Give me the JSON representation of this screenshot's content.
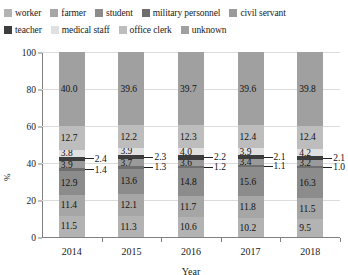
{
  "legend": {
    "rows": [
      [
        {
          "label": "worker",
          "color": "#b3b3b3"
        },
        {
          "label": "farmer",
          "color": "#a6a6a6"
        },
        {
          "label": "student",
          "color": "#8c8c8c"
        },
        {
          "label": "military personnel",
          "color": "#6e6e6e"
        },
        {
          "label": "civil servant",
          "color": "#9a9a9a"
        }
      ],
      [
        {
          "label": "teacher",
          "color": "#3d3d3d"
        },
        {
          "label": "medical staff",
          "color": "#e0e0e0"
        },
        {
          "label": "office clerk",
          "color": "#bdbdbd"
        },
        {
          "label": "unknown",
          "color": "#a0a0a0"
        }
      ]
    ]
  },
  "axis": {
    "ylabel": "%",
    "xlabel": "Year",
    "yticks": [
      "0",
      "20",
      "40",
      "60",
      "80",
      "100"
    ],
    "ylim": [
      0,
      100
    ]
  },
  "chart_data": {
    "type": "bar",
    "stacked": true,
    "normalized_percent": true,
    "title": "",
    "xlabel": "Year",
    "ylabel": "%",
    "ylim": [
      0,
      100
    ],
    "grid": true,
    "legend_position": "top",
    "categories": [
      "2014",
      "2015",
      "2016",
      "2017",
      "2018"
    ],
    "series": [
      {
        "name": "worker",
        "color": "#b3b3b3",
        "values": [
          11.5,
          11.3,
          10.6,
          10.2,
          9.5
        ]
      },
      {
        "name": "farmer",
        "color": "#a6a6a6",
        "values": [
          11.4,
          12.1,
          11.7,
          11.8,
          11.5
        ]
      },
      {
        "name": "student",
        "color": "#8c8c8c",
        "values": [
          12.9,
          13.6,
          14.8,
          15.6,
          16.3
        ]
      },
      {
        "name": "military personnel",
        "color": "#6e6e6e",
        "values": [
          1.4,
          1.3,
          1.2,
          1.1,
          1.0
        ]
      },
      {
        "name": "civil servant",
        "color": "#9a9a9a",
        "values": [
          3.9,
          3.7,
          3.6,
          3.4,
          3.2
        ]
      },
      {
        "name": "teacher",
        "color": "#3d3d3d",
        "values": [
          2.4,
          2.3,
          2.2,
          2.1,
          2.1
        ]
      },
      {
        "name": "medical staff",
        "color": "#e0e0e0",
        "values": [
          3.8,
          3.9,
          4.0,
          3.9,
          4.2
        ]
      },
      {
        "name": "office clerk",
        "color": "#bdbdbd",
        "values": [
          12.7,
          12.2,
          12.3,
          12.4,
          12.4
        ]
      },
      {
        "name": "unknown",
        "color": "#a0a0a0",
        "values": [
          40.0,
          39.6,
          39.7,
          39.6,
          39.8
        ]
      }
    ]
  }
}
